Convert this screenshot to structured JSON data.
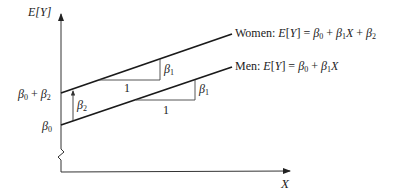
{
  "diagram": {
    "y_axis_label": "E[Y]",
    "x_axis_label": "X",
    "women_label_prefix": "Women: ",
    "women_equation": "E[Y] = β0 + β1X + β2",
    "men_label_prefix": "Men: ",
    "men_equation": "E[Y] = β0 + β1X",
    "intercept_women": "β0 + β2",
    "intercept_men": "β0",
    "gap_label": "β2",
    "slope_run_label": "1",
    "slope_rise_label": "β1"
  },
  "colors": {
    "line": "#1a1a1a",
    "axis": "#333333",
    "text": "#222222"
  }
}
